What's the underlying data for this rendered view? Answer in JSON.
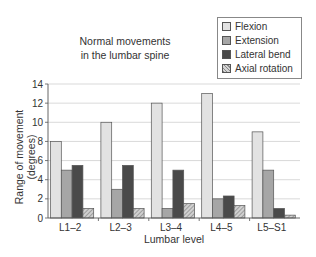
{
  "chart_data": {
    "type": "bar",
    "title": "Normal movements in the lumbar spine",
    "title_lines": [
      "Normal movements",
      "in the lumbar spine"
    ],
    "xlabel": "Lumbar level",
    "ylabel": "Range of movement (degrees)",
    "ylim": [
      0,
      14
    ],
    "yticks": [
      0,
      2,
      4,
      6,
      8,
      10,
      12,
      14
    ],
    "grid": true,
    "legend_position": "upper right",
    "categories": [
      "L1–2",
      "L2–3",
      "L3–4",
      "L4–5",
      "L5–S1"
    ],
    "series": [
      {
        "name": "Flexion",
        "color": "#e2e2e2",
        "pattern": "solid",
        "values": [
          8,
          10,
          12,
          13,
          9
        ]
      },
      {
        "name": "Extension",
        "color": "#a6a6a6",
        "pattern": "solid",
        "values": [
          5,
          3,
          1,
          2,
          5
        ]
      },
      {
        "name": "Lateral bend",
        "color": "#4a4a4a",
        "pattern": "solid",
        "values": [
          5.5,
          5.5,
          5,
          2.3,
          1
        ]
      },
      {
        "name": "Axial rotation",
        "color": "#b8b8b8",
        "pattern": "hatched",
        "values": [
          1,
          1,
          1.5,
          1.3,
          0.3
        ]
      }
    ]
  }
}
